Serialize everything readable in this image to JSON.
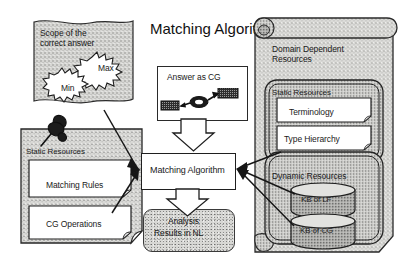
{
  "diagram": {
    "title": "Matching Algorithm",
    "background_color": "#ffffff",
    "ink_color": "#1a1a1a",
    "texture_fill_color": "#d7d7d4",
    "texture_dark_fill_color": "#b9b9b6"
  },
  "flag": {
    "name": "scope-of-correct-answer-flag",
    "line1": "Scope of the",
    "line2": "correct answer",
    "burst_min": "Min",
    "burst_max": "Max"
  },
  "static_resources_panel": {
    "title": "Static Resources",
    "icon": "pushpin-icon",
    "boxes": [
      {
        "label": "Matching Rules"
      },
      {
        "label": "CG Operations"
      }
    ]
  },
  "answer_as_cg": {
    "title": "Answer as CG",
    "graph_nodes": [
      "concept-box-left",
      "relation-oval",
      "concept-box-right"
    ]
  },
  "matching_algorithm": {
    "label": "Matching Algorithm"
  },
  "analysis_results": {
    "line1": "Analysis",
    "line2": "Results in NL"
  },
  "domain_dependent_resources": {
    "title_line1": "Domain Dependent",
    "title_line2": "Resources",
    "static_resources": {
      "title": "Static Resources",
      "boxes": [
        {
          "label": "Terminology"
        },
        {
          "label": "Type Hierarchy"
        }
      ]
    },
    "dynamic_resources": {
      "title": "Dynamic Resources",
      "databases": [
        {
          "label": "KB of LF"
        },
        {
          "label": "KB of CG"
        }
      ]
    }
  },
  "arrows": {
    "block_arrow_cg_to_ma": "down-block-arrow",
    "block_arrow_ma_to_results": "down-block-arrow",
    "thin_arrow_flag_to_ma": "thin-arrow",
    "thin_arrow_matching_rules_to_ma": "thin-arrow",
    "thin_arrow_cg_operations_to_ma": "thin-arrow",
    "thin_arrow_type_hierarchy_to_ma": "thin-arrow",
    "thin_arrow_kb_lf_to_ma": "thin-arrow",
    "thin_arrow_kb_cg_to_ma": "thin-arrow"
  }
}
